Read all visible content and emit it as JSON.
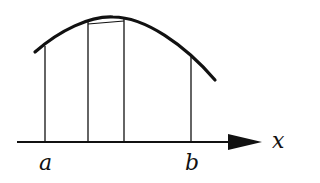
{
  "diagram": {
    "labels": {
      "axis": "x",
      "left_bound": "a",
      "right_bound": "b"
    },
    "colors": {
      "stroke": "#111111",
      "background": "#ffffff"
    }
  }
}
